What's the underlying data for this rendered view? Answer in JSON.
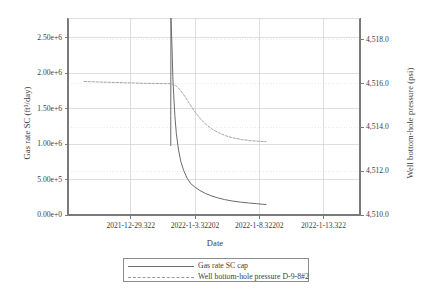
{
  "chart_data": {
    "type": "line",
    "title": "",
    "xlabel": "Date",
    "ylabel": "Gas rate SC (ft³/day)",
    "y2label": "Well bottom-hole pressure (psi)",
    "grid": true,
    "legend_position": "bottom-center",
    "x_tick_labels": [
      "2021-12-29.322",
      "2022-1-3.32202",
      "2022-1-8.32202",
      "2022-1-13.322"
    ],
    "x_tick_positions": [
      0.215,
      0.435,
      0.655,
      0.875
    ],
    "xlim": [
      0,
      1
    ],
    "y_left_tick_labels": [
      "0.00e+0",
      "5.00e+5",
      "1.00e+6",
      "1.50e+6",
      "2.00e+6",
      "2.50e+6"
    ],
    "y_left_tick_values": [
      0,
      500000,
      1000000,
      1500000,
      2000000,
      2500000
    ],
    "ylim": [
      0,
      2780000
    ],
    "y_right_tick_labels": [
      "4,510.0",
      "4,512.0",
      "4,514.0",
      "4,516.0",
      "4,518.0"
    ],
    "y_right_tick_values": [
      4510.0,
      4512.0,
      4514.0,
      4516.0,
      4518.0
    ],
    "y2lim": [
      4510.0,
      4519.0
    ],
    "series": [
      {
        "name": "Gas rate SC cap",
        "axis": "left",
        "style": "solid",
        "color": "#6b6b6b",
        "points": [
          [
            0.352,
            980000
          ],
          [
            0.352,
            1400000
          ],
          [
            0.3525,
            2780000
          ],
          [
            0.356,
            2400000
          ],
          [
            0.359,
            1950000
          ],
          [
            0.362,
            1700000
          ],
          [
            0.366,
            1400000
          ],
          [
            0.371,
            1150000
          ],
          [
            0.378,
            930000
          ],
          [
            0.386,
            760000
          ],
          [
            0.396,
            630000
          ],
          [
            0.408,
            520000
          ],
          [
            0.421,
            440000
          ],
          [
            0.436,
            390000
          ],
          [
            0.452,
            345000
          ],
          [
            0.47,
            305000
          ],
          [
            0.49,
            272000
          ],
          [
            0.512,
            243000
          ],
          [
            0.536,
            218000
          ],
          [
            0.562,
            198000
          ],
          [
            0.59,
            182000
          ],
          [
            0.618,
            170000
          ],
          [
            0.645,
            160000
          ],
          [
            0.665,
            152000
          ],
          [
            0.678,
            148000
          ]
        ]
      },
      {
        "name": "Well bottom-hole pressure D-9-8#2",
        "axis": "right",
        "style": "dashed",
        "color": "#9a9a9a",
        "points": [
          [
            0.055,
            4516.1
          ],
          [
            0.1,
            4516.08
          ],
          [
            0.15,
            4516.06
          ],
          [
            0.2,
            4516.04
          ],
          [
            0.25,
            4516.02
          ],
          [
            0.3,
            4516.01
          ],
          [
            0.34,
            4516.0
          ],
          [
            0.352,
            4516.0
          ],
          [
            0.362,
            4515.96
          ],
          [
            0.372,
            4515.88
          ],
          [
            0.384,
            4515.72
          ],
          [
            0.396,
            4515.5
          ],
          [
            0.41,
            4515.22
          ],
          [
            0.424,
            4514.92
          ],
          [
            0.44,
            4514.62
          ],
          [
            0.456,
            4514.36
          ],
          [
            0.474,
            4514.12
          ],
          [
            0.494,
            4513.92
          ],
          [
            0.516,
            4513.76
          ],
          [
            0.54,
            4513.62
          ],
          [
            0.566,
            4513.52
          ],
          [
            0.594,
            4513.45
          ],
          [
            0.622,
            4513.4
          ],
          [
            0.65,
            4513.37
          ],
          [
            0.678,
            4513.35
          ]
        ]
      }
    ],
    "annotations": []
  },
  "legend": {
    "entries": [
      {
        "label": "Gas rate SC cap",
        "style": "solid"
      },
      {
        "label": "Well bottom-hole pressure D-9-8#2",
        "style": "dashed"
      }
    ]
  },
  "colors": {
    "axis": "#7a7a7a",
    "grid": "#d0d0d0",
    "grid_minor": "#e2e2e2",
    "text": "#3d3d3d",
    "series_gas": "#6b6b6b",
    "series_pressure": "#9a9a9a",
    "background": "#ffffff"
  }
}
